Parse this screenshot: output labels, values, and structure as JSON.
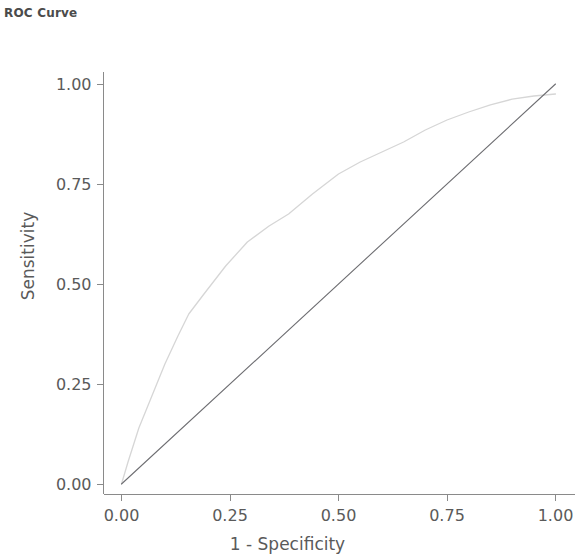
{
  "chart_data": {
    "type": "line",
    "title": "ROC Curve",
    "xlabel": "1 - Specificity",
    "ylabel": "Sensitivity",
    "xlim": [
      0,
      1
    ],
    "ylim": [
      0,
      1
    ],
    "grid": false,
    "legend": "none",
    "xticks": [
      "0.00",
      "0.25",
      "0.50",
      "0.75",
      "1.00"
    ],
    "xtick_values": [
      0,
      0.25,
      0.5,
      0.75,
      1
    ],
    "yticks": [
      "0.00",
      "0.25",
      "0.50",
      "0.75",
      "1.00"
    ],
    "ytick_values": [
      0,
      0.25,
      0.5,
      0.75,
      1
    ],
    "series": [
      {
        "name": "ROC Curve",
        "color": "#d6d6d6",
        "width": 1.3,
        "points": [
          [
            0.0,
            0.0
          ],
          [
            0.015,
            0.055
          ],
          [
            0.04,
            0.14
          ],
          [
            0.07,
            0.22
          ],
          [
            0.1,
            0.3
          ],
          [
            0.13,
            0.37
          ],
          [
            0.155,
            0.425
          ],
          [
            0.19,
            0.475
          ],
          [
            0.24,
            0.545
          ],
          [
            0.29,
            0.605
          ],
          [
            0.34,
            0.645
          ],
          [
            0.385,
            0.675
          ],
          [
            0.44,
            0.725
          ],
          [
            0.5,
            0.775
          ],
          [
            0.55,
            0.805
          ],
          [
            0.6,
            0.83
          ],
          [
            0.65,
            0.855
          ],
          [
            0.7,
            0.885
          ],
          [
            0.75,
            0.91
          ],
          [
            0.8,
            0.93
          ],
          [
            0.85,
            0.948
          ],
          [
            0.9,
            0.962
          ],
          [
            0.95,
            0.97
          ],
          [
            1.0,
            0.975
          ]
        ]
      },
      {
        "name": "Reference Line",
        "color": "#6e6e72",
        "width": 1.1,
        "points": [
          [
            0.0,
            0.0
          ],
          [
            1.0,
            1.0
          ]
        ]
      }
    ],
    "axis_color": "#8a8a8a"
  }
}
